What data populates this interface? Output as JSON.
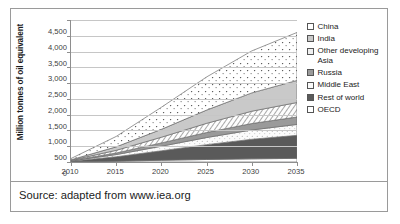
{
  "figure": {
    "source_caption": "Source: adapted from www.iea.org"
  },
  "chart_data": {
    "type": "area",
    "stacked": true,
    "title": "",
    "xlabel": "",
    "ylabel": "Million tonnes of oil equivalent",
    "xlim": [
      2010,
      2035
    ],
    "ylim": [
      0,
      4500
    ],
    "grid": true,
    "legend_position": "right",
    "x": [
      2010,
      2015,
      2020,
      2025,
      2030,
      2035
    ],
    "xticklabels": [
      "2010",
      "2015",
      "2020",
      "2025",
      "2030",
      "2035"
    ],
    "yticks": [
      0,
      500,
      1000,
      1500,
      2000,
      2500,
      3000,
      3500,
      4000,
      4500
    ],
    "yticklabels": [
      "0",
      "500",
      "1,000",
      "1,500",
      "2,000",
      "2,500",
      "3,000",
      "3,500",
      "4,000",
      "4,500"
    ],
    "stack_order_bottom_to_top": [
      "OECD",
      "Rest of world",
      "Middle East",
      "Russia",
      "Other developing Asia",
      "India",
      "China"
    ],
    "series": [
      {
        "name": "China",
        "fill": "dotted-white",
        "color": "#ffffff",
        "values": [
          40,
          330,
          700,
          1050,
          1330,
          1520
        ]
      },
      {
        "name": "India",
        "fill": "solid-light-gray",
        "color": "#c9c9c9",
        "values": [
          15,
          110,
          250,
          420,
          580,
          700
        ]
      },
      {
        "name": "Other developing Asia",
        "fill": "diagonal-hatch",
        "color": "#efefef",
        "values": [
          12,
          85,
          180,
          290,
          390,
          460
        ]
      },
      {
        "name": "Russia",
        "fill": "solid-medium-gray",
        "color": "#9a9a9a",
        "values": [
          8,
          50,
          105,
          160,
          205,
          235
        ]
      },
      {
        "name": "Middle East",
        "fill": "dotted-very-light",
        "color": "#fafafa",
        "values": [
          10,
          70,
          145,
          225,
          295,
          345
        ]
      },
      {
        "name": "Rest of world",
        "fill": "solid-dark-gray",
        "color": "#5a5a5a",
        "values": [
          20,
          140,
          300,
          470,
          620,
          730
        ]
      },
      {
        "name": "OECD",
        "fill": "solid-white",
        "color": "#ffffff",
        "values": [
          5,
          25,
          55,
          80,
          100,
          115
        ]
      }
    ],
    "totals": [
      110,
      810,
      1735,
      2695,
      3520,
      4105
    ]
  },
  "legend": {
    "items": [
      {
        "label": "China",
        "swatch": "pat-china"
      },
      {
        "label": "India",
        "swatch": "pat-india"
      },
      {
        "label": "Other developing Asia",
        "swatch": "pat-odasia"
      },
      {
        "label": "Russia",
        "swatch": "pat-russia"
      },
      {
        "label": "Middle East",
        "swatch": "pat-mideast"
      },
      {
        "label": "Rest of world",
        "swatch": "pat-rest"
      },
      {
        "label": "OECD",
        "swatch": "pat-oecd"
      }
    ]
  }
}
